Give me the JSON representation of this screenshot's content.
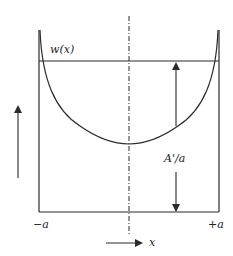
{
  "diagram": {
    "curve_label": "w(x)",
    "gap_label": "A'/a",
    "left_bound_label": "−a",
    "right_bound_label": "+a",
    "x_axis_label": "x",
    "colors": {
      "line": "#2b2b2b",
      "background": "#ffffff"
    }
  }
}
